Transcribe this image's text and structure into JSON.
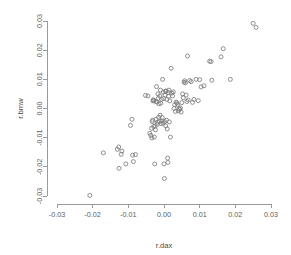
{
  "chart_data": {
    "type": "scatter",
    "title": "",
    "xlabel": "r.dax",
    "ylabel": "r.bmw",
    "xlim": [
      -0.035,
      0.032
    ],
    "ylim": [
      -0.034,
      0.032
    ],
    "xticks": [
      -0.03,
      -0.02,
      -0.01,
      0.0,
      0.01,
      0.02,
      0.03
    ],
    "xticklabels": [
      "-0.03",
      "-0.02",
      "-0.01",
      "0.00",
      "0.01",
      "0.02",
      "0.03"
    ],
    "yticks": [
      -0.03,
      -0.02,
      -0.01,
      0.0,
      0.01,
      0.02,
      0.03
    ],
    "yticklabels": [
      "-0.03",
      "-0.02",
      "-0.01",
      "0.00",
      "0.01",
      "0.02",
      "0.03"
    ],
    "grid": false,
    "legend": false,
    "marker": "open-circle",
    "marker_color": "#7c7c7c",
    "marker_radius": 2.0,
    "points": [
      [
        -0.0208,
        -0.0298
      ],
      [
        -0.017,
        -0.0152
      ],
      [
        -0.0131,
        -0.014
      ],
      [
        -0.0127,
        -0.0132
      ],
      [
        -0.0126,
        -0.0205
      ],
      [
        -0.012,
        -0.0157
      ],
      [
        -0.0118,
        -0.0146
      ],
      [
        -0.0107,
        -0.019
      ],
      [
        -0.0094,
        -0.0058
      ],
      [
        -0.009,
        -0.0037
      ],
      [
        -0.0088,
        -0.016
      ],
      [
        -0.0086,
        -0.0182
      ],
      [
        -0.008,
        -0.0158
      ],
      [
        -0.0052,
        0.0045
      ],
      [
        -0.0045,
        0.0043
      ],
      [
        -0.004,
        -0.0085
      ],
      [
        -0.0037,
        -0.0092
      ],
      [
        -0.0035,
        -0.0068
      ],
      [
        -0.0034,
        -0.0101
      ],
      [
        -0.0033,
        -0.0045
      ],
      [
        -0.0032,
        -0.004
      ],
      [
        -0.0031,
        0.0026
      ],
      [
        -0.003,
        0.003
      ],
      [
        -0.0029,
        -0.0062
      ],
      [
        -0.0028,
        0.0027
      ],
      [
        -0.0027,
        -0.0098
      ],
      [
        -0.0026,
        -0.019
      ],
      [
        -0.0025,
        -0.006
      ],
      [
        -0.0024,
        -0.0073
      ],
      [
        -0.0023,
        0.0024
      ],
      [
        -0.0022,
        -0.0037
      ],
      [
        -0.0021,
        0.0075
      ],
      [
        -0.002,
        0.0022
      ],
      [
        -0.0019,
        -0.0054
      ],
      [
        -0.0018,
        -0.0047
      ],
      [
        -0.0017,
        0.005
      ],
      [
        -0.0016,
        0.0035
      ],
      [
        -0.0015,
        -0.003
      ],
      [
        -0.0014,
        0.0016
      ],
      [
        -0.0013,
        -0.0044
      ],
      [
        -0.0012,
        0.0043
      ],
      [
        -0.0011,
        -0.0023
      ],
      [
        -0.001,
        0.0063
      ],
      [
        -0.0009,
        0.0018
      ],
      [
        -0.0008,
        -0.0052
      ],
      [
        -0.0007,
        0.0032
      ],
      [
        -0.0006,
        -0.0043
      ],
      [
        -0.0005,
        -0.0031
      ],
      [
        -0.0004,
        0.01
      ],
      [
        -0.0003,
        -0.005
      ],
      [
        -0.0002,
        0.0056
      ],
      [
        -0.0001,
        0.0034
      ],
      [
        0.0,
        -0.019
      ],
      [
        0.0001,
        -0.024
      ],
      [
        0.0002,
        -0.0045
      ],
      [
        0.0003,
        0.0046
      ],
      [
        0.0004,
        0.0059
      ],
      [
        0.0005,
        -0.006
      ],
      [
        0.0006,
        0.006
      ],
      [
        0.0007,
        -0.004
      ],
      [
        0.0008,
        0.0031
      ],
      [
        0.0009,
        -0.007
      ],
      [
        0.001,
        -0.017
      ],
      [
        0.0011,
        -0.0185
      ],
      [
        0.0012,
        0.0055
      ],
      [
        0.0013,
        0.0042
      ],
      [
        0.0014,
        0.0063
      ],
      [
        0.0015,
        -0.0046
      ],
      [
        0.0016,
        0.0026
      ],
      [
        0.0018,
        -0.0098
      ],
      [
        0.002,
        0.0138
      ],
      [
        0.0022,
        0.0053
      ],
      [
        0.0024,
        0.0043
      ],
      [
        0.0026,
        0.0057
      ],
      [
        0.0028,
        0.0
      ],
      [
        0.003,
        0.0013
      ],
      [
        0.0032,
        -0.001
      ],
      [
        0.0034,
        0.0022
      ],
      [
        0.0036,
        0.0019
      ],
      [
        0.0038,
        0.0014
      ],
      [
        0.004,
        -0.0008
      ],
      [
        0.0042,
        0.0
      ],
      [
        0.0044,
        -0.0003
      ],
      [
        0.0046,
        0.0002
      ],
      [
        0.0048,
        -0.0012
      ],
      [
        0.005,
        0.002
      ],
      [
        0.0052,
        0.005
      ],
      [
        0.0054,
        0.0037
      ],
      [
        0.0056,
        0.009
      ],
      [
        0.0058,
        0.0095
      ],
      [
        0.006,
        0.0088
      ],
      [
        0.0062,
        0.0046
      ],
      [
        0.0064,
        0.0024
      ],
      [
        0.0066,
        0.018
      ],
      [
        0.0068,
        0.0029
      ],
      [
        0.0072,
        0.0096
      ],
      [
        0.0076,
        0.0092
      ],
      [
        0.008,
        0.0021
      ],
      [
        0.0084,
        0.0031
      ],
      [
        0.009,
        0.01
      ],
      [
        0.0096,
        0.0027
      ],
      [
        0.01,
        0.0099
      ],
      [
        0.0104,
        0.0074
      ],
      [
        0.0112,
        0.0078
      ],
      [
        0.0128,
        0.0162
      ],
      [
        0.0132,
        0.0161
      ],
      [
        0.0134,
        0.0097
      ],
      [
        0.016,
        0.0177
      ],
      [
        0.0166,
        0.0205
      ],
      [
        0.0186,
        0.01
      ],
      [
        0.025,
        0.0292
      ],
      [
        0.0258,
        0.0278
      ]
    ]
  }
}
